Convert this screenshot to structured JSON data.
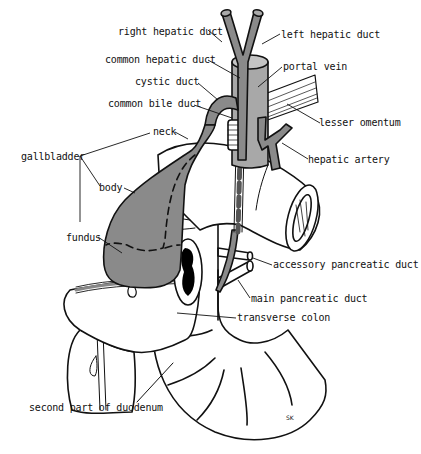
{
  "diagram": {
    "colors": {
      "organ_fill": "#8a8a8a",
      "vessel_fill": "#8a8a8a",
      "outline": "#111111",
      "background": "#ffffff",
      "lumen": "#000000"
    },
    "labels": {
      "right_hepatic_duct": "right hepatic duct",
      "left_hepatic_duct": "left hepatic duct",
      "common_hepatic_duct": "common hepatic duct",
      "portal_vein": "portal vein",
      "cystic_duct": "cystic duct",
      "common_bile_duct": "common bile duct",
      "lesser_omentum": "lesser omentum",
      "neck": "neck",
      "hepatic_artery": "hepatic artery",
      "gallbladder": "gallbladder",
      "body": "body",
      "fundus": "fundus",
      "accessory_pancreatic_duct": "accessory pancreatic duct",
      "main_pancreatic_duct": "main pancreatic duct",
      "transverse_colon": "transverse colon",
      "second_part_of_duodenum": "second part of duodenum"
    },
    "signature": "SK"
  }
}
